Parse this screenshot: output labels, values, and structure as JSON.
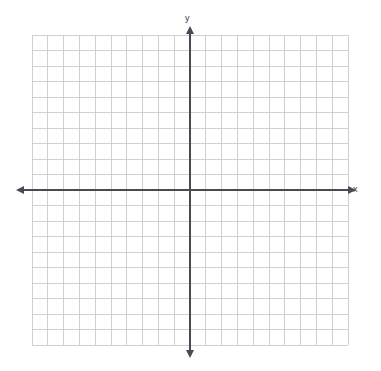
{
  "figure": {
    "kind": "cartesian-coordinate-grid",
    "background_color": "#ffffff",
    "width": 381,
    "height": 371
  },
  "axes": {
    "x_label": "x",
    "y_label": "y",
    "axis_color": "#4a4a52",
    "axis_line_width": 1.7,
    "arrowheads": [
      "left",
      "right",
      "up",
      "down"
    ],
    "origin": {
      "x": 190,
      "y": 190
    }
  },
  "grid": {
    "line_color": "#c6c6cb",
    "minor_line_color": "#dedee2",
    "line_width": 0.8,
    "columns": 20,
    "rows": 20,
    "left": 32,
    "top": 35,
    "right": 348,
    "bottom": 345,
    "cell_width": 15.8,
    "cell_height": 15.5
  },
  "chart_data": {
    "type": "scatter",
    "title": "",
    "subtitle": "",
    "xlabel": "x",
    "ylabel": "y",
    "xlim": [
      -10,
      10
    ],
    "ylim": [
      -10,
      10
    ],
    "xticks": [
      -10,
      -9,
      -8,
      -7,
      -6,
      -5,
      -4,
      -3,
      -2,
      -1,
      0,
      1,
      2,
      3,
      4,
      5,
      6,
      7,
      8,
      9,
      10
    ],
    "yticks": [
      -10,
      -9,
      -8,
      -7,
      -6,
      -5,
      -4,
      -3,
      -2,
      -1,
      0,
      1,
      2,
      3,
      4,
      5,
      6,
      7,
      8,
      9,
      10
    ],
    "xtick_labels": [],
    "ytick_labels": [],
    "grid": true,
    "legend": null,
    "legend_position": "none",
    "annotations": [],
    "series": [],
    "x": [],
    "values": []
  }
}
